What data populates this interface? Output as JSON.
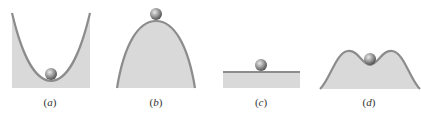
{
  "figure": {
    "colors": {
      "fill": "#d9d9d9",
      "curve": "#8c8c8c",
      "ball_light": "#e6e6e6",
      "ball_dark": "#5a5a5a",
      "label": "#333333"
    },
    "panels": [
      {
        "id": "a",
        "label_open": "(",
        "label_letter": "a",
        "label_close": ")",
        "shape": "valley",
        "label_x": 50
      },
      {
        "id": "b",
        "label_open": "(",
        "label_letter": "b",
        "label_close": ")",
        "shape": "hill",
        "label_x": 156
      },
      {
        "id": "c",
        "label_open": "(",
        "label_letter": "c",
        "label_close": ")",
        "shape": "flat",
        "label_x": 261
      },
      {
        "id": "d",
        "label_open": "(",
        "label_letter": "d",
        "label_close": ")",
        "shape": "double-hump",
        "label_x": 369
      }
    ]
  }
}
